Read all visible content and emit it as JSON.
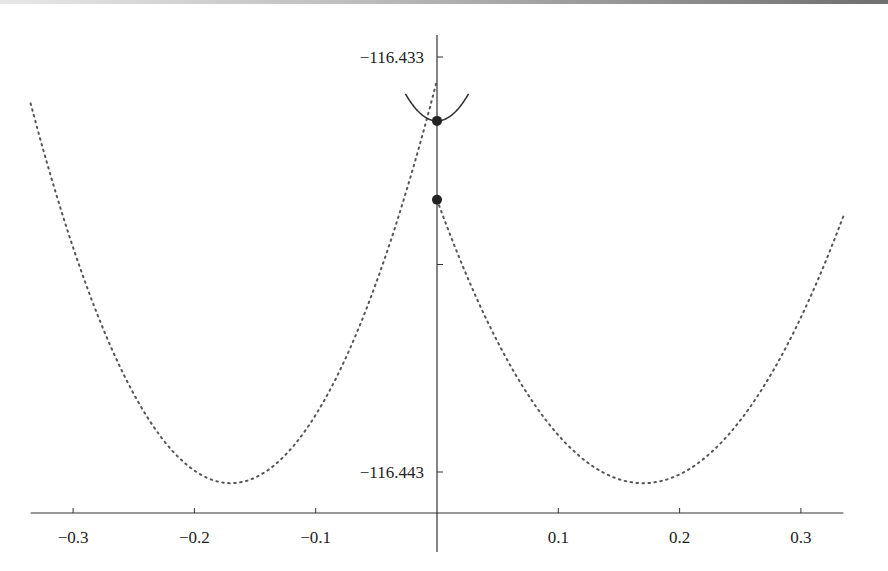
{
  "chart_data": {
    "type": "line",
    "title": "",
    "xlabel": "",
    "ylabel": "",
    "xlim": [
      -0.335,
      0.335
    ],
    "ylim": [
      -116.4443,
      -116.4322
    ],
    "grid": false,
    "legend": null,
    "x_ticks": [
      {
        "value": -0.3,
        "label": "−0.3"
      },
      {
        "value": -0.2,
        "label": "−0.2"
      },
      {
        "value": -0.1,
        "label": "−0.1"
      },
      {
        "value": 0.1,
        "label": "0.1"
      },
      {
        "value": 0.2,
        "label": "0.2"
      },
      {
        "value": 0.3,
        "label": "0.3"
      }
    ],
    "y_ticks": [
      {
        "value": -116.433,
        "label": "−116.433"
      },
      {
        "value": -116.438,
        "label": ""
      },
      {
        "value": -116.443,
        "label": "−116.443"
      }
    ],
    "series": [
      {
        "name": "left-dotted-parabola",
        "style": "dotted",
        "vertex_x": -0.17,
        "vertex_y": -116.44327,
        "x_range": [
          -0.335,
          0.0
        ],
        "x": [
          -0.335,
          -0.3,
          -0.25,
          -0.2,
          -0.17,
          -0.12,
          -0.08,
          -0.04,
          0.0
        ],
        "y": [
          -116.43412,
          -116.43784,
          -116.44129,
          -116.44308,
          -116.44327,
          -116.44245,
          -116.4412,
          -116.43925,
          -116.43644
        ]
      },
      {
        "name": "right-dotted-parabola",
        "style": "dotted",
        "vertex_x": 0.17,
        "vertex_y": -116.44327,
        "x_range": [
          0.0,
          0.335
        ],
        "x": [
          0.0,
          0.04,
          0.08,
          0.12,
          0.17,
          0.2,
          0.25,
          0.3,
          0.335
        ],
        "y": [
          -116.43644,
          -116.43925,
          -116.4412,
          -116.44245,
          -116.44327,
          -116.44308,
          -116.44129,
          -116.43784,
          -116.43412
        ]
      },
      {
        "name": "solid-curve",
        "style": "solid",
        "x": [
          -0.026,
          -0.013,
          0.0,
          0.013,
          0.026
        ],
        "y": [
          -116.43389,
          -116.43438,
          -116.43454,
          -116.43438,
          -116.43389
        ]
      }
    ],
    "points": [
      {
        "name": "upper-point",
        "x": 0.0,
        "y": -116.43454
      },
      {
        "name": "lower-point",
        "x": 0.0,
        "y": -116.43644
      }
    ]
  }
}
